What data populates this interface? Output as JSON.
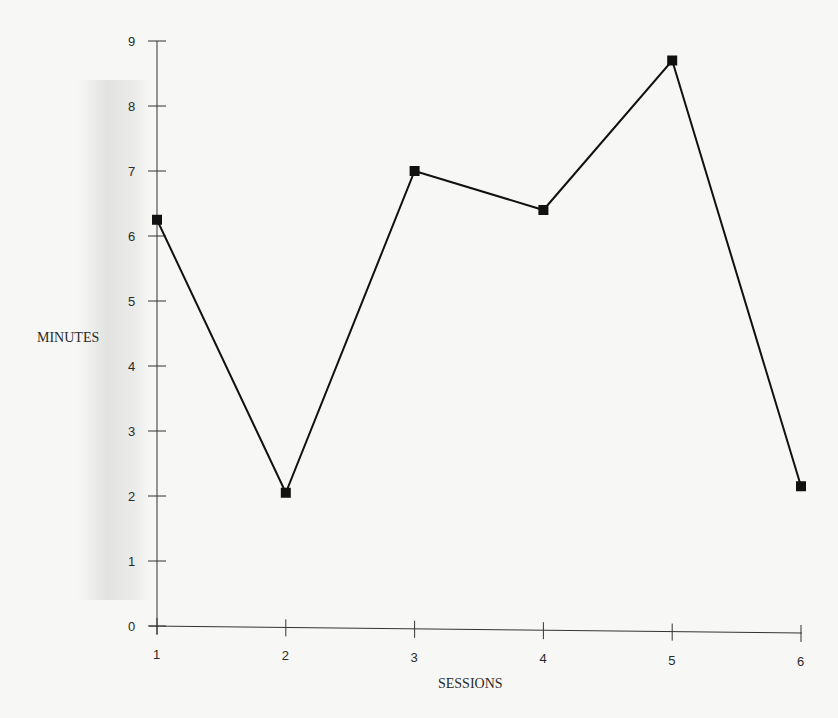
{
  "chart_data": {
    "type": "line",
    "title": "",
    "xlabel": "SESSIONS",
    "ylabel": "MINUTES",
    "categories": [
      "1",
      "2",
      "3",
      "4",
      "5",
      "6"
    ],
    "x": [
      1,
      2,
      3,
      4,
      5,
      6
    ],
    "values": [
      6.25,
      2.05,
      7.0,
      6.4,
      8.7,
      2.15
    ],
    "series": [
      {
        "name": "Minutes",
        "values": [
          6.25,
          2.05,
          7.0,
          6.4,
          8.7,
          2.15
        ],
        "marker": "square",
        "color": "#111111"
      }
    ],
    "ylim": [
      0,
      9
    ],
    "yticks": [
      "0",
      "1",
      "2",
      "3",
      "4",
      "5",
      "6",
      "7",
      "8",
      "9"
    ],
    "xticks": [
      "1",
      "2",
      "3",
      "4",
      "5",
      "6"
    ],
    "grid": false,
    "legend": null
  }
}
